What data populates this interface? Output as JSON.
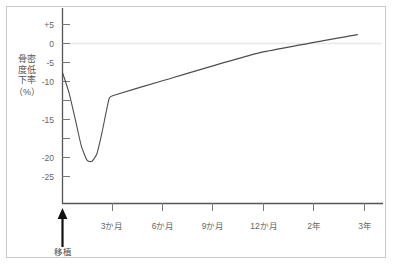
{
  "chart_data": {
    "type": "line",
    "title": "",
    "subtitle": "",
    "xlabel": "",
    "ylabel": "骨密度低下率",
    "ylabel_unit": "（%）",
    "grid": false,
    "zero_line": true,
    "legend": "none",
    "ylim": [
      -29,
      6
    ],
    "yticks": [
      5,
      0,
      -5,
      -10,
      -15,
      -20,
      -25
    ],
    "ytick_labels": [
      "+5",
      "0",
      "-5",
      "-10",
      "-15",
      "-20",
      "-25"
    ],
    "xtick_labels": [
      "3か月",
      "6か月",
      "9か月",
      "12か月",
      "2年",
      "3年"
    ],
    "xtick_values": [
      3,
      6,
      9,
      12,
      24,
      36
    ],
    "xlim": [
      0,
      39
    ],
    "annotations": [
      {
        "name": "transplant-marker",
        "label": "移植",
        "x": 0,
        "arrow": "up"
      }
    ],
    "series": [
      {
        "name": "骨密度低下率",
        "color": "#4d4d4d",
        "points": [
          {
            "x": 0,
            "y": -4.5
          },
          {
            "x": 0.8,
            "y": -8.5
          },
          {
            "x": 1.6,
            "y": -14.0
          },
          {
            "x": 2.3,
            "y": -19.0
          },
          {
            "x": 3.0,
            "y": -21.8
          },
          {
            "x": 3.6,
            "y": -22.0
          },
          {
            "x": 4.2,
            "y": -20.5
          },
          {
            "x": 4.8,
            "y": -16.5
          },
          {
            "x": 5.3,
            "y": -12.5
          },
          {
            "x": 5.7,
            "y": -9.6
          },
          {
            "x": 6.2,
            "y": -9.0
          },
          {
            "x": 12.0,
            "y": -6.2
          },
          {
            "x": 24.0,
            "y": -0.6
          },
          {
            "x": 36.0,
            "y": 3.0
          }
        ]
      }
    ]
  },
  "axis": {
    "y_axis_name": "y-axis",
    "x_axis_name": "x-axis"
  }
}
